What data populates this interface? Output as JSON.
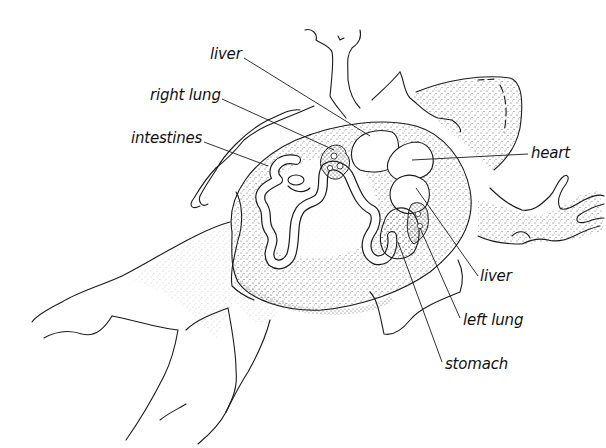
{
  "diagram": {
    "colors": {
      "background": "#ffffff",
      "ink": "#1a1a1a",
      "stipple": "#555555"
    },
    "labels": [
      {
        "id": "liver-top",
        "text": "liver",
        "x": 210,
        "y": 46,
        "target": [
          340,
          132
        ]
      },
      {
        "id": "right-lung",
        "text": "right lung",
        "x": 150,
        "y": 87,
        "target": [
          318,
          150
        ]
      },
      {
        "id": "intestines",
        "text": "intestines",
        "x": 131,
        "y": 130,
        "target": [
          262,
          168
        ]
      },
      {
        "id": "heart",
        "text": "heart",
        "x": 531,
        "y": 145,
        "target": [
          408,
          162
        ]
      },
      {
        "id": "liver-right",
        "text": "liver",
        "x": 480,
        "y": 268,
        "target": [
          418,
          188
        ]
      },
      {
        "id": "left-lung",
        "text": "left lung",
        "x": 463,
        "y": 312,
        "target": [
          418,
          226
        ]
      },
      {
        "id": "stomach",
        "text": "stomach",
        "x": 445,
        "y": 356,
        "target": [
          396,
          240
        ]
      }
    ]
  }
}
